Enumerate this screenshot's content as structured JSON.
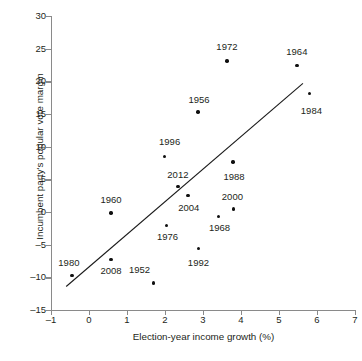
{
  "chart_data": {
    "type": "scatter",
    "title": "",
    "xlabel": "Election-year income growth (%)",
    "ylabel": "Incumbent party's popular vote margin",
    "xlim": [
      -1,
      7
    ],
    "ylim": [
      -15,
      30
    ],
    "xticks": [
      -1,
      0,
      1,
      2,
      3,
      4,
      5,
      6,
      7
    ],
    "xtick_labels": [
      "–1",
      "0",
      "1",
      "2",
      "3",
      "4",
      "5",
      "6",
      "7"
    ],
    "yticks": [
      -15,
      -10,
      -5,
      0,
      5,
      10,
      15,
      20,
      25,
      30
    ],
    "ytick_labels": [
      "–15",
      "–10",
      "–5",
      "0",
      "5",
      "10",
      "15",
      "20",
      "25",
      "30"
    ],
    "grid": false,
    "legend": null,
    "point_label_key": "year",
    "points": [
      {
        "year": "1952",
        "x": 1.7,
        "y": -10.85,
        "label_dx": -14,
        "label_dy": -13
      },
      {
        "year": "1956",
        "x": 2.87,
        "y": 15.3,
        "label_dx": 1,
        "label_dy": -12
      },
      {
        "year": "1960",
        "x": 0.58,
        "y": -0.15,
        "label_dx": 0,
        "label_dy": -13
      },
      {
        "year": "1964",
        "x": 5.47,
        "y": 22.45,
        "label_dx": 0,
        "label_dy": -13
      },
      {
        "year": "1968",
        "x": 3.41,
        "y": -0.7,
        "label_dx": 1,
        "label_dy": 11
      },
      {
        "year": "1972",
        "x": 3.63,
        "y": 23.1,
        "label_dx": 0,
        "label_dy": -14
      },
      {
        "year": "1976",
        "x": 2.04,
        "y": -2.05,
        "label_dx": 1,
        "label_dy": 12
      },
      {
        "year": "1980",
        "x": -0.45,
        "y": -9.7,
        "label_dx": -3,
        "label_dy": -12
      },
      {
        "year": "1984",
        "x": 5.8,
        "y": 18.15,
        "label_dx": 2,
        "label_dy": 18
      },
      {
        "year": "1988",
        "x": 3.79,
        "y": 7.65,
        "label_dx": 1,
        "label_dy": 15
      },
      {
        "year": "1992",
        "x": 2.88,
        "y": -5.6,
        "label_dx": 0,
        "label_dy": 14
      },
      {
        "year": "1996",
        "x": 1.99,
        "y": 8.5,
        "label_dx": 5,
        "label_dy": -14
      },
      {
        "year": "2000",
        "x": 3.8,
        "y": 0.45,
        "label_dx": -1,
        "label_dy": -12
      },
      {
        "year": "2004",
        "x": 2.6,
        "y": 2.5,
        "label_dx": 1,
        "label_dy": 12
      },
      {
        "year": "2008",
        "x": 0.58,
        "y": -7.25,
        "label_dx": 0,
        "label_dy": 12
      },
      {
        "year": "2012",
        "x": 2.34,
        "y": 3.9,
        "label_dx": 0,
        "label_dy": -12
      }
    ],
    "fit_line": {
      "type": "linear-regression",
      "x0": -0.6,
      "y0": -11.4,
      "x1": 5.63,
      "y1": 19.7,
      "color": "#1a1a1a"
    },
    "colors": {
      "axis": "#8a8a8a",
      "point": "#101010",
      "text": "#231f20"
    }
  },
  "caption": {
    "partial_text": ""
  }
}
